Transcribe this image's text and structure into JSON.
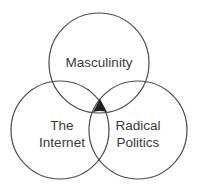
{
  "diagram": {
    "type": "venn",
    "sets": [
      {
        "id": "masculinity",
        "label_lines": [
          "Masculinity"
        ],
        "cx": 99,
        "cy": 63,
        "r": 50
      },
      {
        "id": "internet",
        "label_lines": [
          "The",
          "Internet"
        ],
        "cx": 60,
        "cy": 130,
        "r": 49
      },
      {
        "id": "radical-politics",
        "label_lines": [
          "Radical",
          "Politics"
        ],
        "cx": 138,
        "cy": 130,
        "r": 49
      }
    ],
    "intersection_marker": {
      "shape": "filled-triangle",
      "color": "#222222"
    },
    "colors": {
      "stroke": "#4a4a4a",
      "text": "#3a3a3a",
      "background": "#ffffff"
    }
  }
}
